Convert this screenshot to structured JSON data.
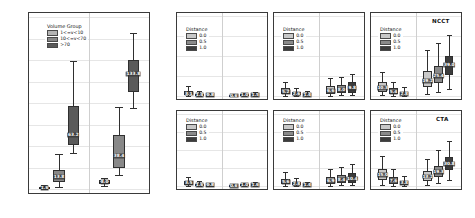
{
  "chart_data": [
    {
      "type": "box",
      "id": "ground-truth-panel",
      "title": "",
      "ylabel": "Volume [ml]",
      "xlabel": "Ground Truth Infarct Volume",
      "ylim": [
        0,
        200
      ],
      "yticks": [
        0,
        25,
        50,
        75,
        100,
        125,
        150,
        175,
        200
      ],
      "categories": [
        "Minimum",
        "Maximum"
      ],
      "legend": {
        "title": "Volume Group",
        "position": "top-left",
        "entries": [
          {
            "label": "1<=v<10",
            "color": "#b4b4b4"
          },
          {
            "label": "10<=v<70",
            "color": "#888888"
          },
          {
            "label": ">70",
            "color": "#5a5a5a"
          }
        ]
      },
      "boxes": [
        {
          "group": "Minimum",
          "series": "1<=v<10",
          "color": "#b4b4b4",
          "q1": 1.0,
          "median": 1.6,
          "q3": 2.6,
          "low": 0.4,
          "high": 4.2,
          "label": "1.6"
        },
        {
          "group": "Minimum",
          "series": "10<=v<70",
          "color": "#888888",
          "q1": 8.0,
          "median": 13.8,
          "q3": 22.0,
          "low": 2.5,
          "high": 41.0,
          "label": "13.8"
        },
        {
          "group": "Minimum",
          "series": ">70",
          "color": "#5a5a5a",
          "q1": 51.0,
          "median": 63.2,
          "q3": 97.0,
          "low": 42.0,
          "high": 149.0,
          "label": "63.2"
        },
        {
          "group": "Maximum",
          "series": "1<=v<10",
          "color": "#b4b4b4",
          "q1": 6.2,
          "median": 8.0,
          "q3": 10.5,
          "low": 4.0,
          "high": 13.0,
          "label": "8.0"
        },
        {
          "group": "Maximum",
          "series": "10<=v<70",
          "color": "#888888",
          "q1": 24.5,
          "median": 38.4,
          "q3": 63.0,
          "low": 16.0,
          "high": 95.0,
          "label": "38.4"
        },
        {
          "group": "Maximum",
          "series": ">70",
          "color": "#5a5a5a",
          "q1": 113.0,
          "median": 133.8,
          "q3": 150.0,
          "low": 94.0,
          "high": 181.0,
          "label": "133.8"
        }
      ]
    },
    {
      "type": "box",
      "id": "ncct-v1-10",
      "modality": "NCCT",
      "panel_title": "1<=v<10 ml",
      "ylabel": "Volume [ml]",
      "ylim": [
        0,
        100
      ],
      "yticks": [
        0,
        25,
        50,
        75,
        100
      ],
      "categories": [
        "Excess Volume",
        "Missing Volume"
      ],
      "legend": {
        "title": "Distance",
        "entries": [
          {
            "label": "0.0",
            "color": "#c8c8c8"
          },
          {
            "label": "0.5",
            "color": "#8a8a8a"
          },
          {
            "label": "1.0",
            "color": "#3c3c3c"
          }
        ]
      },
      "boxes": [
        {
          "group": "Excess Volume",
          "series": "0.0",
          "color": "#c8c8c8",
          "q1": 1.2,
          "median": 3.1,
          "q3": 6.0,
          "low": 0.2,
          "high": 12.0,
          "label": "3.1"
        },
        {
          "group": "Excess Volume",
          "series": "0.5",
          "color": "#8a8a8a",
          "q1": 0.6,
          "median": 1.4,
          "q3": 3.0,
          "low": 0.1,
          "high": 6.0,
          "label": "1.4"
        },
        {
          "group": "Excess Volume",
          "series": "1.0",
          "color": "#3c3c3c",
          "q1": 0.3,
          "median": 0.8,
          "q3": 1.8,
          "low": 0.0,
          "high": 3.6,
          "label": "0.8"
        },
        {
          "group": "Missing Volume",
          "series": "0.0",
          "color": "#c8c8c8",
          "q1": 0.2,
          "median": 0.6,
          "q3": 1.4,
          "low": 0.0,
          "high": 2.8,
          "label": "0.6"
        },
        {
          "group": "Missing Volume",
          "series": "0.5",
          "color": "#8a8a8a",
          "q1": 0.4,
          "median": 1.0,
          "q3": 2.0,
          "low": 0.0,
          "high": 3.8,
          "label": "1.0"
        },
        {
          "group": "Missing Volume",
          "series": "1.0",
          "color": "#3c3c3c",
          "q1": 0.6,
          "median": 1.5,
          "q3": 2.8,
          "low": 0.1,
          "high": 5.0,
          "label": "1.5"
        }
      ]
    },
    {
      "type": "box",
      "id": "ncct-v10-70",
      "modality": "NCCT",
      "panel_title": "10<=v<70 ml",
      "ylabel": "Volume [ml]",
      "ylim": [
        0,
        100
      ],
      "yticks": [
        0,
        25,
        50,
        75,
        100
      ],
      "categories": [
        "Excess Volume",
        "Missing Volume"
      ],
      "legend": {
        "title": "Distance",
        "entries": [
          {
            "label": "0.0",
            "color": "#c8c8c8"
          },
          {
            "label": "0.5",
            "color": "#8a8a8a"
          },
          {
            "label": "1.0",
            "color": "#3c3c3c"
          }
        ]
      },
      "boxes": [
        {
          "group": "Excess Volume",
          "series": "0.0",
          "color": "#c8c8c8",
          "q1": 2.0,
          "median": 5.2,
          "q3": 9.5,
          "low": 0.3,
          "high": 18.0,
          "label": "5.2"
        },
        {
          "group": "Excess Volume",
          "series": "0.5",
          "color": "#8a8a8a",
          "q1": 1.0,
          "median": 2.6,
          "q3": 5.2,
          "low": 0.1,
          "high": 10.0,
          "label": "2.6"
        },
        {
          "group": "Excess Volume",
          "series": "1.0",
          "color": "#3c3c3c",
          "q1": 0.5,
          "median": 1.4,
          "q3": 3.0,
          "low": 0.0,
          "high": 6.0,
          "label": "1.4"
        },
        {
          "group": "Missing Volume",
          "series": "0.0",
          "color": "#c8c8c8",
          "q1": 2.6,
          "median": 6.6,
          "q3": 12.0,
          "low": 0.5,
          "high": 22.0,
          "label": "6.6"
        },
        {
          "group": "Missing Volume",
          "series": "0.5",
          "color": "#8a8a8a",
          "q1": 3.4,
          "median": 8.0,
          "q3": 14.0,
          "low": 0.8,
          "high": 24.0,
          "label": "8.0"
        },
        {
          "group": "Missing Volume",
          "series": "1.0",
          "color": "#3c3c3c",
          "q1": 4.2,
          "median": 9.8,
          "q3": 17.0,
          "low": 1.0,
          "high": 28.0,
          "label": "9.8"
        }
      ]
    },
    {
      "type": "box",
      "id": "ncct-v70",
      "modality": "NCCT",
      "panel_title": ">70 ml",
      "ylabel": "Volume [ml]",
      "ylim": [
        0,
        100
      ],
      "yticks": [
        0,
        25,
        50,
        75,
        100
      ],
      "categories": [
        "Excess Volume",
        "Missing Volume"
      ],
      "legend": {
        "title": "Distance",
        "entries": [
          {
            "label": "0.0",
            "color": "#c8c8c8"
          },
          {
            "label": "0.5",
            "color": "#8a8a8a"
          },
          {
            "label": "1.0",
            "color": "#3c3c3c"
          }
        ]
      },
      "boxes": [
        {
          "group": "Excess Volume",
          "series": "0.0",
          "color": "#c8c8c8",
          "q1": 5.0,
          "median": 10.3,
          "q3": 17.0,
          "low": 1.0,
          "high": 30.0,
          "label": "10.3"
        },
        {
          "group": "Excess Volume",
          "series": "0.5",
          "color": "#8a8a8a",
          "q1": 2.4,
          "median": 5.4,
          "q3": 10.0,
          "low": 0.4,
          "high": 18.0,
          "label": "5.4"
        },
        {
          "group": "Excess Volume",
          "series": "1.0",
          "color": "#3c3c3c",
          "q1": 1.2,
          "median": 2.8,
          "q3": 5.6,
          "low": 0.1,
          "high": 11.0,
          "label": "2.8"
        },
        {
          "group": "Missing Volume",
          "series": "0.0",
          "color": "#c8c8c8",
          "q1": 11.0,
          "median": 19.2,
          "q3": 31.0,
          "low": 3.0,
          "high": 58.0,
          "label": "19.2"
        },
        {
          "group": "Missing Volume",
          "series": "0.5",
          "color": "#8a8a8a",
          "q1": 16.0,
          "median": 25.4,
          "q3": 38.0,
          "low": 5.0,
          "high": 66.0,
          "label": "25.4"
        },
        {
          "group": "Missing Volume",
          "series": "1.0",
          "color": "#3c3c3c",
          "q1": 26.0,
          "median": 39.0,
          "q3": 50.0,
          "low": 9.0,
          "high": 76.0,
          "label": "39.0"
        }
      ]
    },
    {
      "type": "box",
      "id": "cta-v1-10",
      "modality": "CTA",
      "panel_title": "1<=v<10 ml",
      "ylabel": "Volume [ml]",
      "xlabel": "1<=v<10 ml",
      "ylim": [
        0,
        100
      ],
      "yticks": [
        0,
        25,
        50,
        75,
        100
      ],
      "categories": [
        "Excess Volume",
        "Missing Volume"
      ],
      "legend": {
        "title": "Distance",
        "entries": [
          {
            "label": "0.0",
            "color": "#c8c8c8"
          },
          {
            "label": "0.5",
            "color": "#8a8a8a"
          },
          {
            "label": "1.0",
            "color": "#3c3c3c"
          }
        ]
      },
      "boxes": [
        {
          "group": "Excess Volume",
          "series": "0.0",
          "color": "#c8c8c8",
          "q1": 1.4,
          "median": 3.5,
          "q3": 6.4,
          "low": 0.2,
          "high": 13.0,
          "label": "3.5"
        },
        {
          "group": "Excess Volume",
          "series": "0.5",
          "color": "#8a8a8a",
          "q1": 0.7,
          "median": 1.6,
          "q3": 3.2,
          "low": 0.1,
          "high": 6.5,
          "label": "1.6"
        },
        {
          "group": "Excess Volume",
          "series": "1.0",
          "color": "#3c3c3c",
          "q1": 0.3,
          "median": 0.8,
          "q3": 1.8,
          "low": 0.0,
          "high": 3.8,
          "label": "0.8"
        },
        {
          "group": "Missing Volume",
          "series": "0.0",
          "color": "#c8c8c8",
          "q1": 0.2,
          "median": 0.6,
          "q3": 1.3,
          "low": 0.0,
          "high": 2.6,
          "label": "0.6"
        },
        {
          "group": "Missing Volume",
          "series": "0.5",
          "color": "#8a8a8a",
          "q1": 0.4,
          "median": 1.0,
          "q3": 2.1,
          "low": 0.0,
          "high": 4.0,
          "label": "1.0"
        },
        {
          "group": "Missing Volume",
          "series": "1.0",
          "color": "#3c3c3c",
          "q1": 0.6,
          "median": 1.6,
          "q3": 3.0,
          "low": 0.1,
          "high": 5.4,
          "label": "1.6"
        }
      ]
    },
    {
      "type": "box",
      "id": "cta-v10-70",
      "modality": "CTA",
      "panel_title": "10<=v<70 ml",
      "ylabel": "Volume [ml]",
      "xlabel": "10<=v<70 ml",
      "ylim": [
        0,
        100
      ],
      "yticks": [
        0,
        25,
        50,
        75,
        100
      ],
      "categories": [
        "Excess Volume",
        "Missing Volume"
      ],
      "legend": {
        "title": "Distance",
        "entries": [
          {
            "label": "0.0",
            "color": "#c8c8c8"
          },
          {
            "label": "0.5",
            "color": "#8a8a8a"
          },
          {
            "label": "1.0",
            "color": "#3c3c3c"
          }
        ]
      },
      "boxes": [
        {
          "group": "Excess Volume",
          "series": "0.0",
          "color": "#c8c8c8",
          "q1": 2.2,
          "median": 5.6,
          "q3": 10.0,
          "low": 0.3,
          "high": 19.0,
          "label": "5.6"
        },
        {
          "group": "Excess Volume",
          "series": "0.5",
          "color": "#8a8a8a",
          "q1": 1.1,
          "median": 2.8,
          "q3": 5.4,
          "low": 0.1,
          "high": 11.0,
          "label": "2.8"
        },
        {
          "group": "Excess Volume",
          "series": "1.0",
          "color": "#3c3c3c",
          "q1": 0.5,
          "median": 1.4,
          "q3": 3.0,
          "low": 0.0,
          "high": 6.2,
          "label": "1.4"
        },
        {
          "group": "Missing Volume",
          "series": "0.0",
          "color": "#c8c8c8",
          "q1": 2.8,
          "median": 6.9,
          "q3": 12.5,
          "low": 0.5,
          "high": 23.0,
          "label": "6.9"
        },
        {
          "group": "Missing Volume",
          "series": "0.5",
          "color": "#8a8a8a",
          "q1": 3.6,
          "median": 8.4,
          "q3": 15.0,
          "low": 0.8,
          "high": 26.0,
          "label": "8.4"
        },
        {
          "group": "Missing Volume",
          "series": "1.0",
          "color": "#3c3c3c",
          "q1": 4.6,
          "median": 10.4,
          "q3": 18.0,
          "low": 1.0,
          "high": 30.0,
          "label": "10.4"
        }
      ]
    },
    {
      "type": "box",
      "id": "cta-v70",
      "modality": "CTA",
      "panel_title": ">70 ml",
      "ylabel": "Volume [ml]",
      "xlabel": ">70 ml",
      "ylim": [
        0,
        100
      ],
      "yticks": [
        0,
        25,
        50,
        75,
        100
      ],
      "categories": [
        "Excess Volume",
        "Missing Volume"
      ],
      "legend": {
        "title": "Distance",
        "entries": [
          {
            "label": "0.0",
            "color": "#c8c8c8"
          },
          {
            "label": "0.5",
            "color": "#8a8a8a"
          },
          {
            "label": "1.0",
            "color": "#3c3c3c"
          }
        ]
      },
      "boxes": [
        {
          "group": "Excess Volume",
          "series": "0.0",
          "color": "#c8c8c8",
          "q1": 8.0,
          "median": 15.0,
          "q3": 24.0,
          "low": 1.5,
          "high": 42.0,
          "label": "15.0"
        },
        {
          "group": "Excess Volume",
          "series": "0.5",
          "color": "#8a8a8a",
          "q1": 3.4,
          "median": 7.6,
          "q3": 13.0,
          "low": 0.5,
          "high": 24.0,
          "label": "7.6"
        },
        {
          "group": "Excess Volume",
          "series": "1.0",
          "color": "#3c3c3c",
          "q1": 1.6,
          "median": 3.8,
          "q3": 7.2,
          "low": 0.2,
          "high": 14.0,
          "label": "3.8"
        },
        {
          "group": "Missing Volume",
          "series": "0.0",
          "color": "#c8c8c8",
          "q1": 7.0,
          "median": 13.2,
          "q3": 21.0,
          "low": 2.0,
          "high": 37.0,
          "label": "13.2"
        },
        {
          "group": "Missing Volume",
          "series": "0.5",
          "color": "#8a8a8a",
          "q1": 12.0,
          "median": 19.3,
          "q3": 28.0,
          "low": 4.0,
          "high": 50.0,
          "label": "19.3"
        },
        {
          "group": "Missing Volume",
          "series": "1.0",
          "color": "#3c3c3c",
          "q1": 22.0,
          "median": 30.8,
          "q3": 40.0,
          "low": 8.0,
          "high": 62.0,
          "label": "30.8"
        }
      ]
    }
  ],
  "figure": {
    "background": "#ffffff",
    "grid": true,
    "row_tags": [
      "NCCT",
      "CTA"
    ],
    "shared_xtick_labels": [
      "Excess Volume",
      "Missing Volume"
    ]
  }
}
